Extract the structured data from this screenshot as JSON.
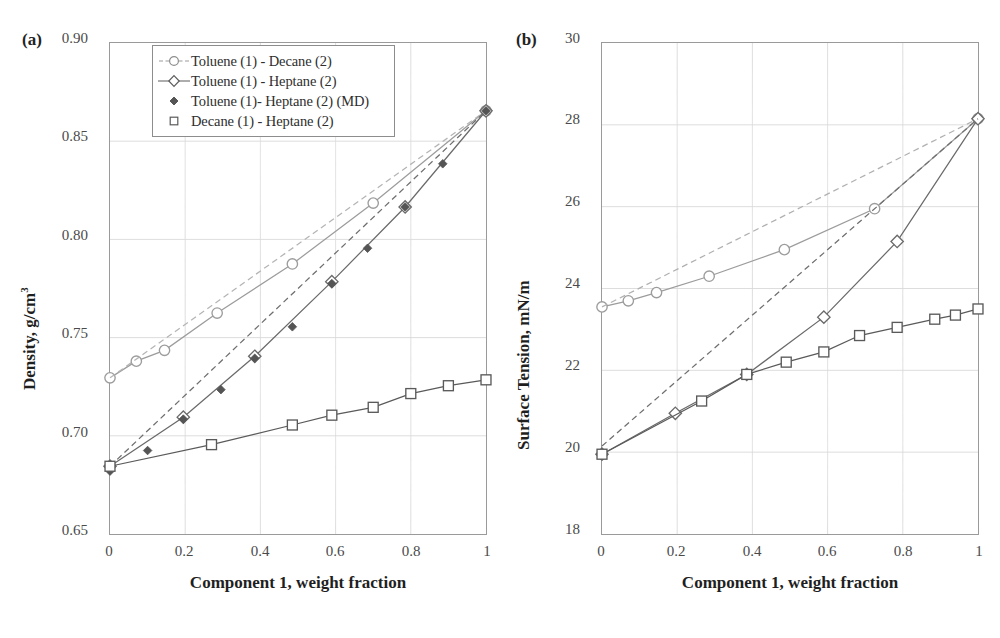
{
  "figure": {
    "panels": [
      {
        "tag": "(a)",
        "xlabel": "Component 1, weight fraction",
        "ylabel_main": "Density, g/cm",
        "ylabel_sup": "3",
        "yticks": [
          "0.90",
          "0.85",
          "0.80",
          "0.75",
          "0.70",
          "0.65"
        ],
        "xticks": [
          "0",
          "0.2",
          "0.4",
          "0.6",
          "0.8",
          "1"
        ]
      },
      {
        "tag": "(b)",
        "xlabel": "Component 1, weight fraction",
        "ylabel_main": "Surface Tension, mN/m",
        "ylabel_sup": "",
        "yticks": [
          "30",
          "28",
          "26",
          "24",
          "22",
          "20",
          "18"
        ],
        "xticks": [
          "0",
          "0.2",
          "0.4",
          "0.6",
          "0.8",
          "1"
        ]
      }
    ],
    "legend": {
      "items": [
        {
          "label": "Toluene (1) - Decane (2)",
          "marker": "circle-open",
          "line": "solid",
          "color": "#9c9c9c"
        },
        {
          "label": "Toluene (1) - Heptane (2)",
          "marker": "diamond-open",
          "line": "solid",
          "color": "#6a6a6a"
        },
        {
          "label": "Toluene (1)- Heptane (2) (MD)",
          "marker": "diamond-filled",
          "line": "none",
          "color": "#555555"
        },
        {
          "label": "Decane (1) - Heptane (2)",
          "marker": "square-open",
          "line": "solid",
          "color": "#5a5a5a"
        }
      ]
    }
  },
  "chart_data": [
    {
      "type": "line",
      "panel": "(a)",
      "title": "",
      "xlabel": "Component 1, weight fraction",
      "ylabel": "Density, g/cm3",
      "xlim": [
        0,
        1
      ],
      "ylim": [
        0.65,
        0.9
      ],
      "xticks": [
        0,
        0.2,
        0.4,
        0.6,
        0.8,
        1
      ],
      "yticks": [
        0.65,
        0.7,
        0.75,
        0.8,
        0.85,
        0.9
      ],
      "grid": true,
      "legend_position": "top-center-inside",
      "series": [
        {
          "name": "Toluene (1) - Decane (2)",
          "marker": "circle-open",
          "line": "solid",
          "color": "#9c9c9c",
          "x": [
            0.0,
            0.07,
            0.145,
            0.285,
            0.485,
            0.7,
            1.0
          ],
          "y": [
            0.7295,
            0.738,
            0.7435,
            0.7625,
            0.7875,
            0.8185,
            0.8655
          ]
        },
        {
          "name": "Toluene (1) - Decane (2) ideal",
          "marker": "none",
          "line": "dashed",
          "color": "#b4b4b4",
          "x": [
            0.0,
            1.0
          ],
          "y": [
            0.7295,
            0.8655
          ]
        },
        {
          "name": "Toluene (1) - Heptane (2)",
          "marker": "diamond-open",
          "line": "solid",
          "color": "#6a6a6a",
          "x": [
            0.0,
            0.195,
            0.385,
            0.59,
            0.785,
            1.0
          ],
          "y": [
            0.6845,
            0.7095,
            0.7405,
            0.7785,
            0.8165,
            0.8655
          ]
        },
        {
          "name": "Toluene (1) - Heptane (2) ideal",
          "marker": "none",
          "line": "dashed",
          "color": "#6e6e6e",
          "x": [
            0.0,
            1.0
          ],
          "y": [
            0.6845,
            0.8655
          ]
        },
        {
          "name": "Toluene (1)- Heptane (2) (MD)",
          "marker": "diamond-filled",
          "line": "none",
          "color": "#555555",
          "x": [
            0.0,
            0.1,
            0.195,
            0.295,
            0.385,
            0.485,
            0.59,
            0.685,
            0.785,
            0.885,
            1.0
          ],
          "y": [
            0.682,
            0.6925,
            0.7085,
            0.7235,
            0.7395,
            0.7555,
            0.7775,
            0.7955,
            0.8165,
            0.8385,
            0.8655
          ]
        },
        {
          "name": "Decane (1) - Heptane (2)",
          "marker": "square-open",
          "line": "solid",
          "color": "#5a5a5a",
          "x": [
            0.0,
            0.27,
            0.485,
            0.59,
            0.7,
            0.8,
            0.9,
            1.0
          ],
          "y": [
            0.6845,
            0.6955,
            0.7055,
            0.7105,
            0.7145,
            0.7215,
            0.7255,
            0.7285
          ]
        }
      ]
    },
    {
      "type": "line",
      "panel": "(b)",
      "title": "",
      "xlabel": "Component 1, weight fraction",
      "ylabel": "Surface Tension, mN/m",
      "xlim": [
        0,
        1
      ],
      "ylim": [
        18,
        30
      ],
      "xticks": [
        0,
        0.2,
        0.4,
        0.6,
        0.8,
        1
      ],
      "yticks": [
        18,
        20,
        22,
        24,
        26,
        28,
        30
      ],
      "grid": true,
      "legend_position": "none",
      "series": [
        {
          "name": "Toluene (1) - Decane (2)",
          "marker": "circle-open",
          "line": "solid",
          "color": "#9c9c9c",
          "x": [
            0.0,
            0.07,
            0.145,
            0.285,
            0.485,
            0.725,
            1.0
          ],
          "y": [
            23.55,
            23.7,
            23.9,
            24.3,
            24.95,
            25.95,
            28.15
          ]
        },
        {
          "name": "Toluene (1) - Decane (2) ideal",
          "marker": "none",
          "line": "dashed",
          "color": "#b0b0b0",
          "x": [
            0.0,
            1.0
          ],
          "y": [
            23.55,
            28.15
          ]
        },
        {
          "name": "Toluene (1) - Heptane (2)",
          "marker": "diamond-open",
          "line": "solid",
          "color": "#6a6a6a",
          "x": [
            0.0,
            0.195,
            0.385,
            0.59,
            0.785,
            1.0
          ],
          "y": [
            19.95,
            20.95,
            21.9,
            23.3,
            25.15,
            28.15
          ]
        },
        {
          "name": "Toluene (1) - Heptane (2) ideal",
          "marker": "none",
          "line": "dashed",
          "color": "#6e6e6e",
          "x": [
            0.0,
            1.0
          ],
          "y": [
            20.15,
            28.15
          ]
        },
        {
          "name": "Toluene (1)- Heptane (2) (MD)",
          "marker": "diamond-filled",
          "line": "none",
          "color": "#555555",
          "x": [
            0.0
          ],
          "y": [
            19.95
          ]
        },
        {
          "name": "Decane (1) - Heptane (2)",
          "marker": "square-open",
          "line": "solid",
          "color": "#5a5a5a",
          "x": [
            0.0,
            0.265,
            0.385,
            0.49,
            0.59,
            0.685,
            0.785,
            0.885,
            0.94,
            1.0
          ],
          "y": [
            19.95,
            21.25,
            21.9,
            22.2,
            22.45,
            22.85,
            23.05,
            23.25,
            23.35,
            23.5
          ]
        }
      ]
    }
  ]
}
